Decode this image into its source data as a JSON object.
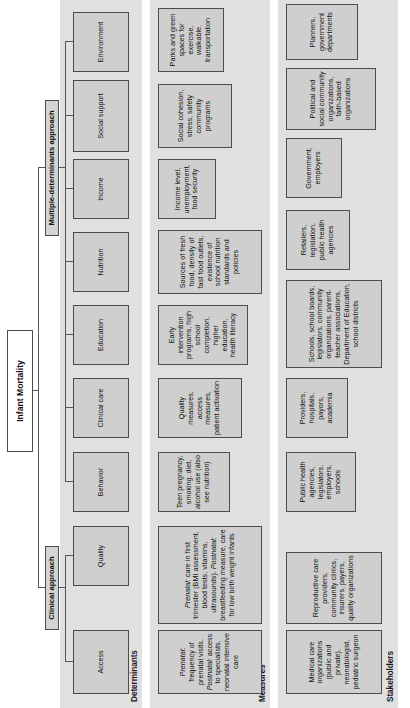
{
  "diagram": {
    "title": "Infant Mortality",
    "orientation": "rotated-90-ccw",
    "root": "Infant Mortality",
    "approaches": [
      {
        "id": "clinical",
        "label": "Clinical approach"
      },
      {
        "id": "multiple",
        "label": "Multiple-determinants approach"
      }
    ],
    "bands": [
      {
        "id": "determinants",
        "label": "Determinants"
      },
      {
        "id": "measures",
        "label": "Measures"
      },
      {
        "id": "stakeholders",
        "label": "Stakeholders"
      }
    ],
    "columns": [
      {
        "id": "access",
        "determinant": "Access",
        "measures": "Prenatal: frequency of prenatal visits. Postnatal: access to specialists, neonatal intensive care",
        "measures_html": "<em>Prenatal:</em> frequency of prenatal visits. <em>Postnatal:</em> access to specialists, neonatal intensive care",
        "stakeholders": "Medical care organizations (public and private), neonatologist, pediatric surgeon"
      },
      {
        "id": "quality",
        "determinant": "Quality",
        "measures": "Prenatal: care in first trimester (BMI assessment, blood tests, vitamins, ultrasounds). Postnatal: breastfeeding measure, care for low birth weight infants",
        "measures_html": "<em>Prenatal:</em> care in first trimester (BMI assessment, blood tests, vitamins, ultrasounds). <em>Postnatal:</em> breastfeeding measure, care for low birth weight infants",
        "stakeholders": "Reproductive care providers, community clinics, insurers, payers, quality organizations"
      },
      {
        "id": "behavior",
        "determinant": "Behavior",
        "measures": "Teen pregnancy, smoking, diet, alcohol use (also see nutrition)",
        "measures_html": "Teen pregnancy, smoking, diet, alcohol use (also see nutrition)",
        "stakeholders": "Public health agencies, legislators, employers, schools"
      },
      {
        "id": "clinical-care",
        "determinant": "Clinical care",
        "measures": "Quality measures, access measures, patient activation",
        "measures_html": "Quality measures, access measures, patient activation",
        "stakeholders": "Providers, hospitals, payors, academia"
      },
      {
        "id": "education",
        "determinant": "Education",
        "measures": "Early intervention programs, high school completion, higher education, health literacy",
        "measures_html": "Early intervention programs, high school completion, higher education, health literacy",
        "stakeholders": "Schools, school boards, legislators, community organizations, parent-teacher associations, Department of Education, school districts"
      },
      {
        "id": "nutrition",
        "determinant": "Nutrition",
        "measures": "Sources of fresh food, density of fast food outlets, existence of school nutrition standards and policies",
        "measures_html": "Sources of fresh food, density of fast food outlets, existence of school nutrition standards and policies",
        "stakeholders": "Retailers, legislation, public health agencies"
      },
      {
        "id": "income",
        "determinant": "Income",
        "measures": "Income level, unemployment, food security",
        "measures_html": "Income level, unemployment, food security",
        "stakeholders": "Government, employers"
      },
      {
        "id": "social-support",
        "determinant": "Social support",
        "measures": "Social cohesion, stress, safety community programs",
        "measures_html": "Social cohesion, stress, safety community programs",
        "stakeholders": "Political and social community organizations, faith-based organizations"
      },
      {
        "id": "environment",
        "determinant": "Environment",
        "measures": "Parks and green spaces for exercise, walkable, transportation",
        "measures_html": "Parks and green spaces for exercise, walkable, transportation",
        "stakeholders": "Planners, government departments"
      }
    ],
    "colors": {
      "band_background": "#e0e0e0",
      "node_fill": "#cfcfcf",
      "node_border": "#4c4c4c",
      "root_fill": "#ffffff",
      "line": "#555555",
      "text": "#111111"
    }
  }
}
